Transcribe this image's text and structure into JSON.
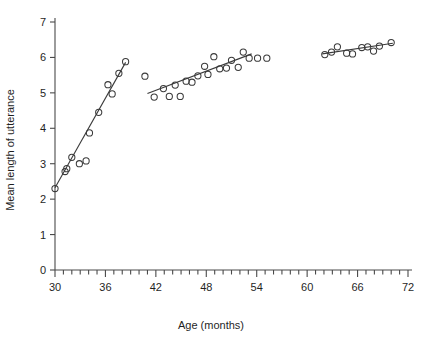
{
  "chart_data": {
    "type": "scatter",
    "title": "",
    "xlabel": "Age (months)",
    "ylabel": "Mean length of utterance",
    "xlim": [
      30,
      72
    ],
    "ylim": [
      0,
      7
    ],
    "xticks": [
      30,
      36,
      42,
      48,
      54,
      60,
      66,
      72
    ],
    "xtick_labels": [
      "30",
      "36",
      "42",
      "48",
      "54",
      "60",
      "66",
      "72"
    ],
    "x_minor_tick_step": 1,
    "yticks": [
      0,
      1,
      2,
      3,
      4,
      5,
      6,
      7
    ],
    "ytick_labels": [
      "0",
      "1",
      "2",
      "3",
      "4",
      "5",
      "6",
      "7"
    ],
    "grid": false,
    "legend": false,
    "marker": "open-circle",
    "marker_color": "#3a3a3a",
    "line_color": "#3a3a3a",
    "series": [
      {
        "name": "Mean length of utterance",
        "points": [
          [
            30.0,
            2.3
          ],
          [
            31.2,
            2.78
          ],
          [
            31.4,
            2.86
          ],
          [
            32.0,
            3.18
          ],
          [
            32.9,
            3.0
          ],
          [
            33.7,
            3.08
          ],
          [
            34.1,
            3.87
          ],
          [
            35.2,
            4.45
          ],
          [
            36.3,
            5.23
          ],
          [
            36.8,
            4.97
          ],
          [
            37.6,
            5.55
          ],
          [
            38.4,
            5.88
          ],
          [
            40.7,
            5.47
          ],
          [
            41.8,
            4.88
          ],
          [
            42.9,
            5.12
          ],
          [
            43.6,
            4.9
          ],
          [
            44.3,
            5.22
          ],
          [
            44.9,
            4.9
          ],
          [
            45.6,
            5.33
          ],
          [
            46.3,
            5.3
          ],
          [
            47.0,
            5.48
          ],
          [
            47.8,
            5.75
          ],
          [
            48.2,
            5.52
          ],
          [
            48.9,
            6.02
          ],
          [
            49.6,
            5.68
          ],
          [
            50.4,
            5.7
          ],
          [
            51.0,
            5.92
          ],
          [
            51.8,
            5.72
          ],
          [
            52.4,
            6.15
          ],
          [
            53.1,
            5.98
          ],
          [
            54.1,
            5.98
          ],
          [
            55.2,
            5.98
          ],
          [
            62.1,
            6.08
          ],
          [
            62.9,
            6.15
          ],
          [
            63.6,
            6.3
          ],
          [
            64.7,
            6.12
          ],
          [
            65.4,
            6.1
          ],
          [
            66.5,
            6.28
          ],
          [
            67.2,
            6.3
          ],
          [
            67.9,
            6.18
          ],
          [
            68.6,
            6.32
          ],
          [
            70.0,
            6.42
          ]
        ]
      }
    ],
    "fit_lines": [
      {
        "name": "segment-1",
        "x0": 30.0,
        "y0": 2.32,
        "x1": 38.4,
        "y1": 5.86
      },
      {
        "name": "segment-2",
        "x0": 41.0,
        "y0": 4.98,
        "x1": 53.4,
        "y1": 6.1
      },
      {
        "name": "segment-3",
        "x0": 61.8,
        "y0": 6.1,
        "x1": 70.2,
        "y1": 6.4
      }
    ]
  }
}
